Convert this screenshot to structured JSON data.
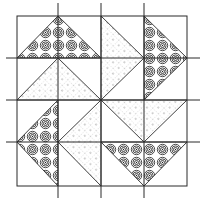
{
  "diagram": {
    "type": "quilt-block",
    "grid": {
      "rows": 4,
      "cols": 4
    },
    "colors": {
      "background": "#ffffff",
      "line": "#2a2a2a",
      "spiral": "#1e1e1e",
      "dot": "#555555"
    },
    "grid_x": [
      17,
      58,
      101,
      144,
      187
    ],
    "grid_y": [
      16,
      58,
      100,
      142,
      186
    ],
    "spiral_triangles": [
      {
        "name": "top",
        "points": "17,58 58,16 101,58"
      },
      {
        "name": "right",
        "points": "144,16 187,58 144,100"
      },
      {
        "name": "bottom",
        "points": "101,142 144,186 187,142"
      },
      {
        "name": "left",
        "points": "58,100 17,142 58,186"
      }
    ],
    "dotted_triangles": [
      {
        "name": "upper-left",
        "points": "17,100 58,58 101,100"
      },
      {
        "name": "upper-right",
        "points": "101,16 144,58 101,100"
      },
      {
        "name": "lower-right",
        "points": "101,100 144,142 187,100"
      },
      {
        "name": "lower-left",
        "points": "101,100 58,142 101,186"
      }
    ]
  }
}
